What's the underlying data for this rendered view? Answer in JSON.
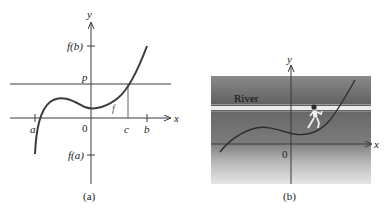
{
  "panel_a": {
    "caption": "(a)",
    "axis_x_label": "x",
    "axis_y_label": "y",
    "label_fb": "f(b)",
    "label_fa": "f(a)",
    "label_p": "p",
    "label_origin": "0",
    "label_a": "a",
    "label_b": "b",
    "label_c": "c",
    "label_curve": "f"
  },
  "panel_b": {
    "caption": "(b)",
    "axis_x_label": "x",
    "axis_y_label": "y",
    "label_origin": "0",
    "label_river": "River",
    "figure_icon": "runner-icon"
  },
  "colors": {
    "line": "#3a3a3a",
    "river_band": "#e8e8e8",
    "bg_top": "#6e6e6e",
    "bg_bottom": "#e4e4e4"
  }
}
